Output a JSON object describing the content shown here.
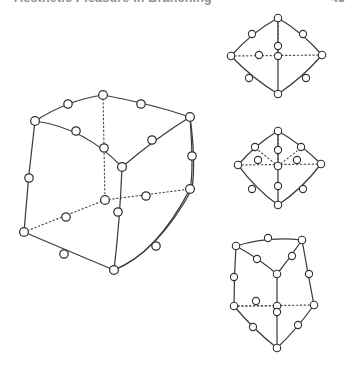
{
  "page": {
    "background_color": "#ffffff",
    "width": 355,
    "height": 367
  },
  "header": {
    "title": "Aesthetic Pleasure in Branching",
    "page_number": "45",
    "color": "#8f9196",
    "clipped": "true"
  },
  "footer": {
    "text": "",
    "color": "#c9cacd"
  },
  "figure": {
    "caption": "",
    "node_style": {
      "fill": "#ffffff",
      "stroke": "#2f2f37",
      "radius_large": 4.2,
      "radius_small": 3.2
    },
    "edge_style": {
      "solid_color": "#3b3b43",
      "dotted_color": "#4a4a52",
      "solid_width": 1.25,
      "dotted_width": 1.15
    },
    "panels": [
      {
        "id": "panel-main-cube",
        "name": "large-subdivided-cube",
        "position": "left",
        "vertex_count": 8,
        "subdivision_count": 12,
        "total_nodes": 20,
        "hidden_edges": 3,
        "description": "Large subdivided cube graph drawn in oblique projection with one hidden rear vertex joined by dotted edges."
      },
      {
        "id": "panel-top-right",
        "name": "subdivided-tetrahedron-upper",
        "position": "top-right",
        "vertex_count": 5,
        "subdivision_count": 8,
        "total_nodes": 13,
        "hidden_edges": 2,
        "description": "Subdivided rhombic/tetrahedral graph with one dotted horizontal rear edge."
      },
      {
        "id": "panel-middle-right",
        "name": "subdivided-tetrahedron-lower",
        "position": "middle-right",
        "vertex_count": 5,
        "subdivision_count": 10,
        "total_nodes": 15,
        "hidden_edges": 4,
        "description": "Subdivided rhombic/tetrahedral graph with a central node and several dotted interior edges."
      },
      {
        "id": "panel-bottom-right",
        "name": "small-subdivided-cube",
        "position": "bottom-right",
        "vertex_count": 8,
        "subdivision_count": 12,
        "total_nodes": 20,
        "hidden_edges": 3,
        "description": "Smaller subdivided cube graph in oblique projection with dotted rear edges."
      }
    ]
  }
}
